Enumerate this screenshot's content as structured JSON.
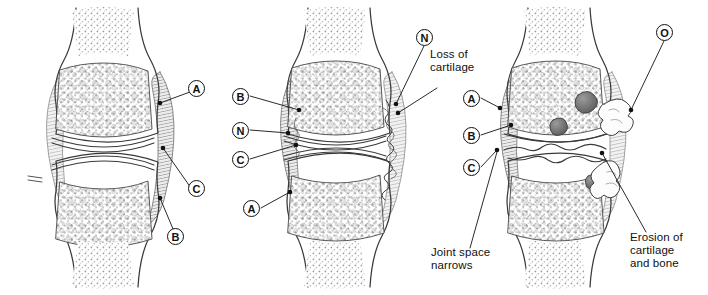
{
  "figure": {
    "background_color": "#ffffff",
    "ink_color": "#333333",
    "panel_count": 3
  },
  "panels": [
    {
      "id": "panel-normal",
      "stage": "normal joint",
      "center_x": 108,
      "markers": [
        {
          "letter": "A",
          "x": 196,
          "y": 88,
          "anchor_x": 160,
          "anchor_y": 103
        },
        {
          "letter": "C",
          "x": 196,
          "y": 192,
          "anchor_x": 163,
          "anchor_y": 148
        },
        {
          "letter": "B",
          "x": 175,
          "y": 240,
          "anchor_x": 160,
          "anchor_y": 198
        }
      ]
    },
    {
      "id": "panel-moderate",
      "stage": "cartilage loss",
      "center_x": 340,
      "markers": [
        {
          "letter": "B",
          "x": 232,
          "y": 90,
          "anchor_x": 299,
          "anchor_y": 110
        },
        {
          "letter": "N",
          "x": 232,
          "y": 124,
          "anchor_x": 288,
          "anchor_y": 133
        },
        {
          "letter": "C",
          "x": 232,
          "y": 153,
          "anchor_x": 296,
          "anchor_y": 145
        },
        {
          "letter": "A",
          "x": 243,
          "y": 204,
          "anchor_x": 290,
          "anchor_y": 192
        },
        {
          "letter": "N",
          "x": 422,
          "y": 27,
          "anchor_x": 395,
          "anchor_y": 108
        }
      ]
    },
    {
      "id": "panel-severe",
      "stage": "erosion of cartilage and bone",
      "center_x": 560,
      "markers": [
        {
          "letter": "A",
          "x": 463,
          "y": 92,
          "anchor_x": 500,
          "anchor_y": 108
        },
        {
          "letter": "B",
          "x": 463,
          "y": 131,
          "anchor_x": 511,
          "anchor_y": 125
        },
        {
          "letter": "C",
          "x": 463,
          "y": 163,
          "anchor_x": 497,
          "anchor_y": 150
        },
        {
          "letter": "O",
          "x": 662,
          "y": 22,
          "anchor_x": 628,
          "anchor_y": 110
        }
      ]
    }
  ],
  "annotations": [
    {
      "id": "loss-of-cartilage",
      "text": "Loss of\ncartilage",
      "x": 430,
      "y": 55,
      "leader_from_x": 440,
      "leader_from_y": 88,
      "leader_to_x": 398,
      "leader_to_y": 113
    },
    {
      "id": "joint-space-narrows",
      "text": "Joint space\nnarrows",
      "x": 431,
      "y": 253,
      "leader_from_x": 470,
      "leader_from_y": 250,
      "leader_to_x": 497,
      "leader_to_y": 150
    },
    {
      "id": "erosion-of-cartilage-and-bone",
      "text": "Erosion of\ncartilage\nand bone",
      "x": 630,
      "y": 238,
      "leader_from_x": 645,
      "leader_from_y": 234,
      "leader_to_x": 601,
      "leader_to_y": 152
    }
  ]
}
